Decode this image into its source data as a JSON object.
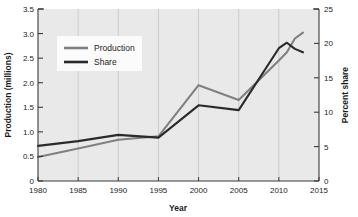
{
  "chart_data": {
    "type": "line",
    "title": "",
    "xlabel": "Year",
    "ylabel": "Production (millions)",
    "y2label": "Percent share",
    "xlim": [
      1980,
      2015
    ],
    "ylim": [
      0,
      3.5
    ],
    "y2lim": [
      0,
      25
    ],
    "grid": "vertical",
    "legend_position": "upper-left-inside",
    "xticks": [
      "1980",
      "1985",
      "1990",
      "1995",
      "2000",
      "2005",
      "2010",
      "2015"
    ],
    "xtick_values": [
      1980,
      1985,
      1990,
      1995,
      2000,
      2005,
      2010,
      2015
    ],
    "yticks": [
      "0",
      "0.5",
      "1.0",
      "1.5",
      "2.0",
      "2.5",
      "3.0",
      "3.5"
    ],
    "ytick_values": [
      0,
      0.5,
      1.0,
      1.5,
      2.0,
      2.5,
      3.0,
      3.5
    ],
    "y2ticks": [
      "0",
      "5",
      "10",
      "15",
      "20",
      "25"
    ],
    "y2tick_values": [
      0,
      5,
      10,
      15,
      20,
      25
    ],
    "series": [
      {
        "name": "Production",
        "axis": "left",
        "color": "#808080",
        "x": [
          1980,
          1985,
          1990,
          1995,
          2000,
          2005,
          2010,
          2011,
          2012,
          2013
        ],
        "values": [
          0.49,
          0.66,
          0.84,
          0.91,
          1.95,
          1.65,
          2.45,
          2.62,
          2.9,
          3.02
        ]
      },
      {
        "name": "Share",
        "axis": "right",
        "color": "#2a2a2a",
        "x": [
          1980,
          1985,
          1990,
          1995,
          2000,
          2005,
          2010,
          2011,
          2012,
          2013
        ],
        "values": [
          5.1,
          5.8,
          6.7,
          6.3,
          11.0,
          10.3,
          19.3,
          20.1,
          19.2,
          18.7
        ]
      }
    ]
  },
  "legend": {
    "entries": [
      {
        "label": "Production",
        "color": "#808080"
      },
      {
        "label": "Share",
        "color": "#2a2a2a"
      }
    ]
  },
  "axes": {
    "left_title": "Production (millions)",
    "right_title": "Percent share",
    "bottom_title": "Year"
  },
  "colors": {
    "plot_background": "#e9e9e9",
    "page_background": "#ffffff",
    "gridline": "#c4c4c4",
    "axis": "#3a3a3a",
    "production": "#808080",
    "share": "#2a2a2a"
  }
}
